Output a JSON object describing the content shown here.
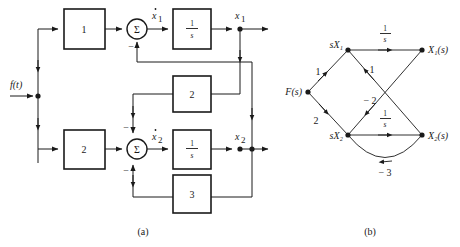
{
  "figure": {
    "width": 460,
    "height": 247,
    "background": "#ffffff",
    "ink": "#1a1a1a",
    "captions": [
      {
        "id": "a",
        "text": "(a)",
        "x": 143,
        "y": 232
      },
      {
        "id": "b",
        "text": "(b)",
        "x": 370,
        "y": 232
      }
    ]
  },
  "panel_a": {
    "name": "block-diagram",
    "input_label": "f(t)",
    "blocks": [
      {
        "id": "gain-1-top",
        "label": "1",
        "x": 64,
        "y": 9,
        "w": 41,
        "h": 40
      },
      {
        "id": "integrator-1",
        "label": "1/s",
        "numerator": "1",
        "denominator": "s",
        "x": 173,
        "y": 9,
        "w": 38,
        "h": 40
      },
      {
        "id": "gain-2-left",
        "label": "2",
        "x": 64,
        "y": 130,
        "w": 41,
        "h": 39
      },
      {
        "id": "integrator-2",
        "label": "1/s",
        "numerator": "1",
        "denominator": "s",
        "x": 173,
        "y": 130,
        "w": 38,
        "h": 39
      },
      {
        "id": "feedback-2",
        "label": "2",
        "x": 173,
        "y": 76,
        "w": 38,
        "h": 36
      },
      {
        "id": "feedback-3",
        "label": "3",
        "x": 173,
        "y": 175,
        "w": 38,
        "h": 38
      }
    ],
    "summers": [
      {
        "id": "summer-1",
        "glyph": "Σ",
        "cx": 137,
        "cy": 29,
        "r": 10,
        "signs": [
          {
            "text": "−",
            "x": 131,
            "y": 47
          }
        ]
      },
      {
        "id": "summer-2",
        "glyph": "Σ",
        "cx": 137,
        "cy": 149,
        "r": 10,
        "signs": [
          {
            "text": "−",
            "x": 128,
            "y": 128
          },
          {
            "text": "−",
            "x": 128,
            "y": 171
          }
        ]
      }
    ],
    "signals": [
      {
        "id": "x1dot",
        "text": "ẋ₁",
        "base": "x",
        "sub": "1",
        "dot": true,
        "x": 154,
        "y": 16
      },
      {
        "id": "x1",
        "text": "x₁",
        "base": "x",
        "sub": "1",
        "dot": false,
        "x": 240,
        "y": 16
      },
      {
        "id": "x2dot",
        "text": "ẋ₂",
        "base": "x",
        "sub": "2",
        "dot": true,
        "x": 154,
        "y": 136
      },
      {
        "id": "x2",
        "text": "x₂",
        "base": "x",
        "sub": "2",
        "dot": false,
        "x": 240,
        "y": 136
      }
    ]
  },
  "panel_b": {
    "name": "signal-flow-graph",
    "nodes": [
      {
        "id": "F",
        "label": "F(s)",
        "x": 308,
        "y": 92,
        "label_x": 288,
        "label_y": 95,
        "anchor": "end"
      },
      {
        "id": "sX1",
        "label": "sX₁",
        "x": 348,
        "y": 50,
        "label_x": 342,
        "label_y": 48,
        "anchor": "end"
      },
      {
        "id": "X1",
        "label": "X₁(s)",
        "x": 422,
        "y": 50,
        "label_x": 428,
        "label_y": 53,
        "anchor": "start"
      },
      {
        "id": "sX2",
        "label": "sX₂",
        "x": 348,
        "y": 135,
        "label_x": 342,
        "label_y": 138,
        "anchor": "end"
      },
      {
        "id": "X2",
        "label": "X₂(s)",
        "x": 422,
        "y": 135,
        "label_x": 428,
        "label_y": 138,
        "anchor": "start"
      }
    ],
    "edges": [
      {
        "id": "F-to-sX1",
        "from": "F",
        "to": "sX1",
        "gain": "1",
        "gx": 318,
        "gy": 72,
        "type": "line"
      },
      {
        "id": "F-to-sX2",
        "from": "F",
        "to": "sX2",
        "gain": "2",
        "gx": 318,
        "gy": 120,
        "type": "line"
      },
      {
        "id": "sX1-to-X1",
        "from": "sX1",
        "to": "X1",
        "gain": "1/s",
        "numerator": "1",
        "denominator": "s",
        "gx": 385,
        "gy": 33,
        "type": "line"
      },
      {
        "id": "sX2-to-X2",
        "from": "sX2",
        "to": "X2",
        "gain": "1/s",
        "numerator": "1",
        "denominator": "s",
        "gx": 385,
        "gy": 118,
        "type": "line"
      },
      {
        "id": "X2-to-sX1",
        "from": "X2",
        "to": "sX1",
        "gain": "1",
        "gx": 368,
        "gy": 70,
        "type": "line"
      },
      {
        "id": "X1-to-sX2",
        "from": "X1",
        "to": "sX2",
        "gain": "− 2",
        "gx": 372,
        "gy": 100,
        "type": "line"
      },
      {
        "id": "X2-to-sX2",
        "from": "X2",
        "to": "sX2",
        "gain": "− 3",
        "gx": 385,
        "gy": 172,
        "type": "arc"
      }
    ]
  }
}
